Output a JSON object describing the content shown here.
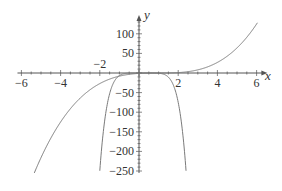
{
  "chart_data": {
    "type": "line",
    "title": "",
    "xlabel": "x",
    "ylabel": "y",
    "xlim": [
      -6.3,
      6.5
    ],
    "ylim": [
      -255,
      140
    ],
    "grid": false,
    "legend": null,
    "x_ticks": [
      -6,
      -4,
      -2,
      2,
      4,
      6
    ],
    "x_tick_labels": [
      "−6",
      "−4",
      "−2",
      "2",
      "4",
      "6"
    ],
    "y_ticks": [
      100,
      50,
      -50,
      -100,
      -150,
      -200,
      -250
    ],
    "y_tick_labels": [
      "100",
      "50",
      "−50",
      "−100",
      "−150",
      "−200",
      "−250"
    ],
    "series": [
      {
        "name": "cubic curve",
        "description": "increasing curve, flat near origin, rising to ~125 at x=6, descending to -250 near x=-5.3",
        "x": [
          -5.3,
          -5,
          -4,
          -3,
          -2,
          -1,
          0,
          1,
          2,
          3,
          4,
          5,
          6
        ],
        "values": [
          -250,
          -216,
          -125,
          -64,
          -27,
          -8,
          -1,
          0,
          1,
          8,
          27,
          64,
          125
        ]
      },
      {
        "name": "steep downward curve",
        "description": "narrow curve with maximum near 0 at origin, falling to -250 near x=-2 and x=2.4",
        "x": [
          -2,
          -1.5,
          -1,
          -0.5,
          0,
          0.2,
          0.5,
          1,
          1.5,
          2,
          2.4
        ],
        "values": [
          -250,
          -102,
          -33,
          -6,
          0,
          0,
          0,
          -1,
          -11,
          -75,
          -250
        ]
      }
    ],
    "annotations": []
  },
  "colors": {
    "curve": "#7a7a7a",
    "axis": "#555555",
    "text": "#333333",
    "background": "#ffffff"
  }
}
